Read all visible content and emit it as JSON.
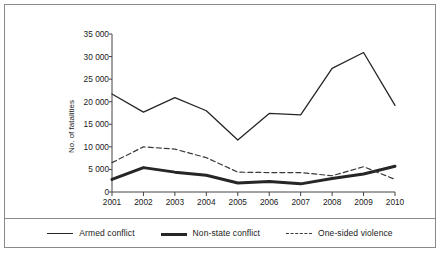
{
  "chart_data": {
    "type": "line",
    "title": "",
    "xlabel": "",
    "ylabel": "No. of fatalities",
    "categories": [
      "2001",
      "2002",
      "2003",
      "2004",
      "2005",
      "2006",
      "2007",
      "2008",
      "2009",
      "2010"
    ],
    "x": [
      2001,
      2002,
      2003,
      2004,
      2005,
      2006,
      2007,
      2008,
      2009,
      2010
    ],
    "ylim": [
      0,
      35000
    ],
    "xlim": [
      2001,
      2010
    ],
    "grid": false,
    "legend_position": "bottom",
    "yticks": [
      0,
      5000,
      10000,
      15000,
      20000,
      25000,
      30000,
      35000
    ],
    "ytick_labels": [
      "0",
      "5 000",
      "10 000",
      "15 000",
      "20 000",
      "25 000",
      "30 000",
      "35 000"
    ],
    "series": [
      {
        "name": "Armed conflict",
        "style": "solid-thin",
        "color": "#262626",
        "values": [
          21700,
          17700,
          20900,
          18000,
          11500,
          17400,
          17100,
          27400,
          30900,
          19200
        ]
      },
      {
        "name": "Non-state conflict",
        "style": "solid-thick",
        "color": "#262626",
        "values": [
          2800,
          5400,
          4400,
          3700,
          2000,
          2300,
          1800,
          3000,
          4000,
          5700
        ]
      },
      {
        "name": "One-sided violence",
        "style": "dashed",
        "color": "#3a3a3a",
        "values": [
          6500,
          10000,
          9500,
          7600,
          4400,
          4300,
          4300,
          3600,
          5600,
          2800
        ]
      }
    ]
  },
  "legend": {
    "items": [
      {
        "label": "Armed conflict"
      },
      {
        "label": "Non-state conflict"
      },
      {
        "label": "One-sided violence"
      }
    ]
  },
  "axes": {
    "y_axis_title": "No. of fatalities"
  }
}
